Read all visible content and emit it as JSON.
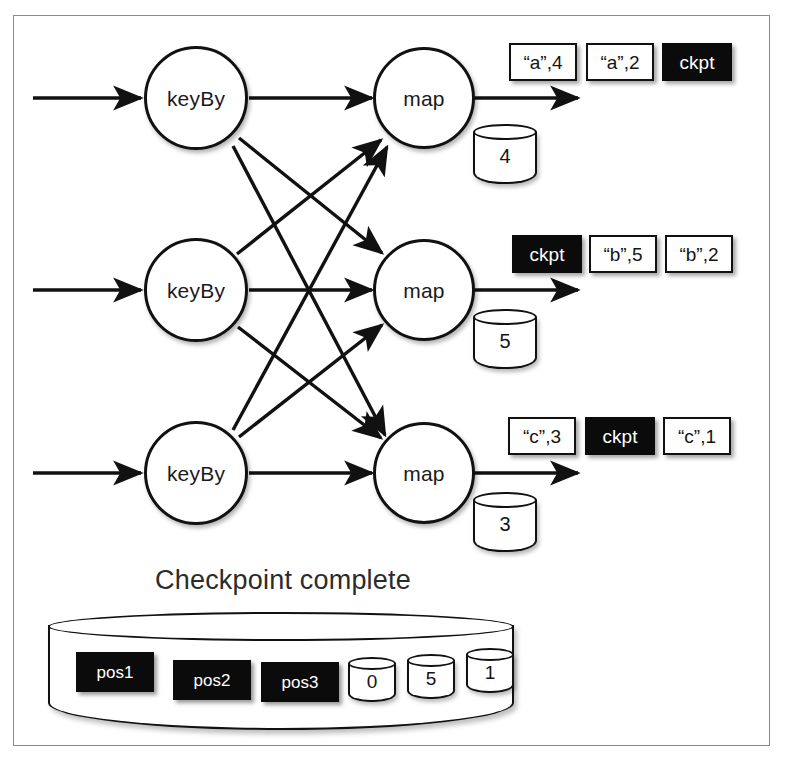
{
  "figure": {
    "caption": "Checkpoint complete",
    "border_color": "#8a8a8a",
    "ink_color": "#111111",
    "dark_fill": "#0b0b0b"
  },
  "pipeline": {
    "rows": [
      {
        "source_label": "keyBy",
        "operator_label": "map",
        "state_value": "4",
        "output_stream": [
          {
            "label": "“a”,4",
            "kind": "record"
          },
          {
            "label": "“a”,2",
            "kind": "record"
          },
          {
            "label": "ckpt",
            "kind": "barrier"
          }
        ]
      },
      {
        "source_label": "keyBy",
        "operator_label": "map",
        "state_value": "5",
        "output_stream": [
          {
            "label": "ckpt",
            "kind": "barrier"
          },
          {
            "label": "“b”,5",
            "kind": "record"
          },
          {
            "label": "“b”,2",
            "kind": "record"
          }
        ]
      },
      {
        "source_label": "keyBy",
        "operator_label": "map",
        "state_value": "3",
        "output_stream": [
          {
            "label": "“c”,3",
            "kind": "record"
          },
          {
            "label": "ckpt",
            "kind": "barrier"
          },
          {
            "label": "“c”,1",
            "kind": "record"
          }
        ]
      }
    ]
  },
  "storage": {
    "positions": [
      {
        "label": "pos1"
      },
      {
        "label": "pos2"
      },
      {
        "label": "pos3"
      }
    ],
    "state_snapshots": [
      {
        "label": "0"
      },
      {
        "label": "5"
      },
      {
        "label": "1"
      }
    ]
  }
}
